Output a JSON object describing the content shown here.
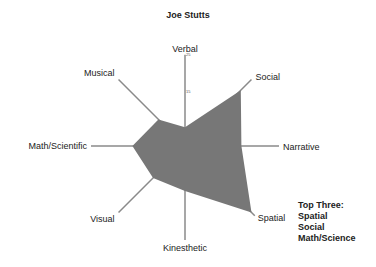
{
  "chart_data": {
    "type": "radar",
    "title": "Joe Stutts",
    "categories": [
      "Verbal",
      "Social",
      "Narrative",
      "Spatial",
      "Kinesthetic",
      "Visual",
      "Math/Scientific",
      "Musical"
    ],
    "series": [
      {
        "name": "Joe Stutts",
        "values": [
          5,
          21,
          15,
          25,
          12,
          12,
          14,
          10
        ],
        "color": "#777777"
      }
    ],
    "rlim": [
      0,
      25
    ],
    "tick_labels": [
      "15",
      "25"
    ],
    "grid": false,
    "legend": "none",
    "annotation": {
      "heading": "Top Three:",
      "items": [
        "Spatial",
        "Social",
        "Math/Science"
      ]
    }
  },
  "colors": {
    "fill": "#777777",
    "axis": "#8a8a8a",
    "text": "#222222"
  }
}
